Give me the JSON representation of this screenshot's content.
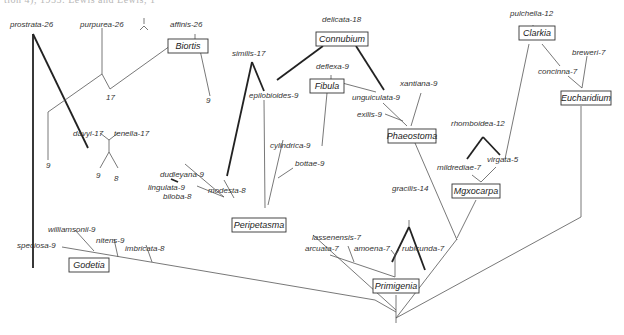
{
  "caption": "tion 4), 1955: Lewis and Lewis, 1",
  "sections": {
    "biortis": "Biortis",
    "connubium": "Connubium",
    "fibula": "Fibula",
    "clarkia": "Clarkia",
    "eucharidium": "Eucharidium",
    "phaeostoma": "Phaeostoma",
    "myxocarpa": "Mgxocarpa",
    "peripetasma": "Peripetasma",
    "primigenia": "Primigenia",
    "godetia": "Godetia"
  },
  "species": {
    "prostrata": "prostrata-26",
    "purpurea": "purpurea-26",
    "affinis": "affinis-26",
    "delicata": "delicata-18",
    "pulchella": "pulchella-12",
    "breweri": "breweri-7",
    "concinna": "concinna-7",
    "similis": "similis-17",
    "epilobioides": "epilobioides-9",
    "deflexa": "deflexa-9",
    "unguiculata": "unguiculata-9",
    "xantiana": "xantiana-9",
    "exilis": "exilis-9",
    "rhomboidea": "rhomboidea-12",
    "mildrediae": "mildrediae-7",
    "virgata": "virgata-5",
    "davyi": "davyi-17",
    "tenella": "tenella-17",
    "cylindrica": "cylindrica-9",
    "bottae": "bottae-9",
    "dudleyana": "dudleyana-9",
    "lingulata": "lingulata-9",
    "biloba": "biloba-8",
    "modesta": "modesta-8",
    "gracilis": "gracilis-14",
    "lassenensis": "lassenensis-7",
    "arcuata": "arcuata-7",
    "amoena": "amoena-7",
    "rubicunda": "rubicunda-7",
    "williamsonii": "williamsonii-9",
    "nitens": "nitens-9",
    "imbricata": "imbricata-8",
    "speciosa": "speciosa-9"
  },
  "chromosome_numbers": {
    "n17_mid": "17",
    "n9_biortis": "9",
    "n9_left": "9",
    "n9_tenella": "9",
    "n8_tenella": "8"
  }
}
